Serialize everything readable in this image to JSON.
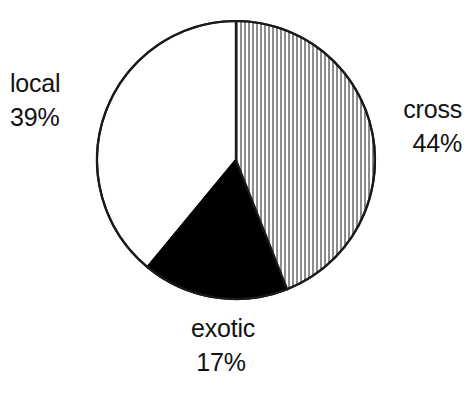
{
  "chart_data": {
    "type": "pie",
    "title": "",
    "subtitle": "",
    "xlabel": "",
    "ylabel": "",
    "legend_position": "none",
    "grid": false,
    "units": "percent",
    "start_angle_deg": 0,
    "direction": "clockwise",
    "categories": [
      "cross",
      "exotic",
      "local"
    ],
    "values": [
      44,
      17,
      39
    ],
    "slices": [
      {
        "label": "cross",
        "value": 44,
        "value_text": "44%",
        "fill": "vertical-hatch-gray",
        "fill_color": "#8d8d8d",
        "background_color": "#ffffff",
        "label_position": "right",
        "start_deg": 0,
        "end_deg": 158.4
      },
      {
        "label": "exotic",
        "value": 17,
        "value_text": "17%",
        "fill": "solid-black",
        "fill_color": "#000000",
        "background_color": "#000000",
        "label_position": "bottom",
        "start_deg": 158.4,
        "end_deg": 219.6
      },
      {
        "label": "local",
        "value": 39,
        "value_text": "39%",
        "fill": "solid-white",
        "fill_color": "#ffffff",
        "background_color": "#ffffff",
        "label_position": "left",
        "start_deg": 219.6,
        "end_deg": 360
      }
    ],
    "outline_color": "#1a1a1a",
    "text_color": "#121212"
  },
  "labels": {
    "local": {
      "name": "local",
      "value": "39%"
    },
    "cross": {
      "name": "cross",
      "value": "44%"
    },
    "exotic": {
      "name": "exotic",
      "value": "17%"
    }
  }
}
